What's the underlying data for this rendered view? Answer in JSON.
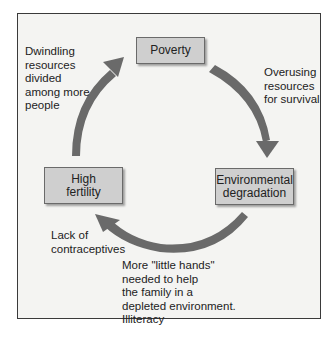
{
  "diagram": {
    "type": "cycle",
    "nodes": [
      {
        "id": "poverty",
        "label": "Poverty"
      },
      {
        "id": "environmental_degradation",
        "label": "Environmental degradation"
      },
      {
        "id": "high_fertility",
        "label": "High fertility"
      }
    ],
    "edges": [
      {
        "from": "poverty",
        "to": "environmental_degradation",
        "label": "Overusing resources for survival"
      },
      {
        "from": "environmental_degradation",
        "to": "high_fertility",
        "label": "More \"little hands\" needed to help the family in a depleted environment. Illiteracy"
      },
      {
        "from": "environmental_degradation",
        "to": "high_fertility",
        "label": "Lack of contraceptives"
      },
      {
        "from": "high_fertility",
        "to": "poverty",
        "label": "Dwindling resources divided among more people"
      }
    ]
  },
  "nodes": {
    "poverty": [
      "Poverty"
    ],
    "env": [
      "Environmental",
      "degradation"
    ],
    "fertility": [
      "High",
      "fertility"
    ]
  },
  "labels": {
    "dwindling": [
      "Dwindling",
      "resources",
      "divided",
      "among more",
      "people"
    ],
    "overusing": [
      "Overusing",
      "resources",
      "for survival"
    ],
    "lack": [
      "Lack of",
      "contraceptives"
    ],
    "hands": [
      "More \"little hands\"",
      "needed to help",
      "the family in a",
      "depleted environment.",
      "Illiteracy"
    ]
  },
  "colors": {
    "arrow": "#6a6a6a",
    "node_fill": "#cfcfcf",
    "background": "#f4f4f2"
  }
}
